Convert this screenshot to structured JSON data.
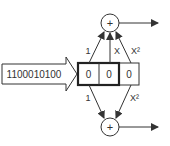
{
  "diagram": {
    "input_sequence": "1100010100",
    "register_cells": [
      "0",
      "0",
      "0"
    ],
    "top_adder": {
      "symbol": "+",
      "tap_labels": [
        "1",
        "X",
        "X²"
      ]
    },
    "bottom_adder": {
      "symbol": "+",
      "tap_labels": [
        "1",
        "X²"
      ]
    },
    "colors": {
      "stroke": "#333333",
      "background": "#ffffff"
    }
  }
}
